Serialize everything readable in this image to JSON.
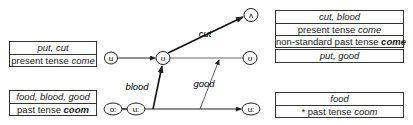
{
  "left_boxes": [
    {
      "rows": [
        {
          "italic": "put, cut"
        },
        {
          "plain": "present tense ",
          "italic": "come"
        }
      ]
    },
    {
      "rows": [
        {
          "italic": "food, blood, good"
        },
        {
          "plain": "past tense ",
          "bold_italic": "coom"
        }
      ]
    }
  ],
  "right_boxes": [
    {
      "rows": [
        {
          "italic": "cut, blood"
        },
        {
          "plain": "present tense ",
          "italic": "come"
        },
        {
          "plain": "non-standard past tense ",
          "bold_italic": "come"
        }
      ]
    },
    {
      "rows": [
        {
          "italic": "put, good"
        }
      ]
    },
    {
      "rows": [
        {
          "italic": "food"
        },
        {
          "plain": "* past tense ",
          "italic": "coom"
        }
      ]
    }
  ],
  "nodes": {
    "u_left": "u",
    "upsilon_center": "ʊ",
    "wedge_top": "ʌ",
    "upsilon_right": "ʊ",
    "o_long": "o:",
    "u_long_left": "u:",
    "u_long_right": "u:"
  },
  "edges": {
    "cut": "cut",
    "blood": "blood",
    "good": "good"
  }
}
